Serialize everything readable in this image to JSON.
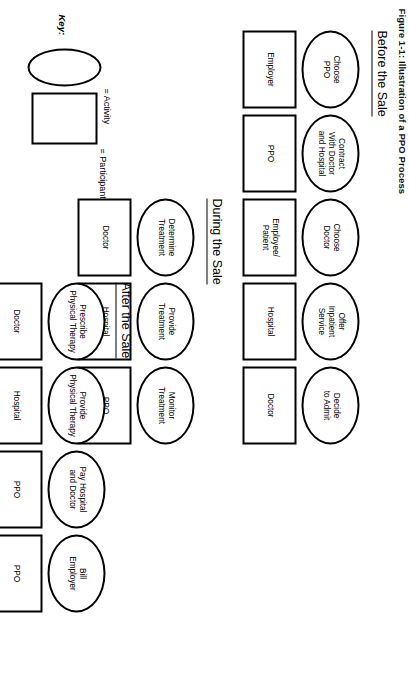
{
  "figure": {
    "caption": "Figure 1-1: Illustration of a PPO Process"
  },
  "sections": [
    {
      "id": "before-the-sale",
      "title": "Before the Sale",
      "nodes": [
        {
          "activity": "Choose\nPPO",
          "participant": "Employer"
        },
        {
          "activity": "Contract\nWith Doctor\nand Hospital",
          "participant": "PPO"
        },
        {
          "activity": "Choose\nDoctor",
          "participant": "Employee/\nPatient"
        },
        {
          "activity": "Offer\nInpatient\nService",
          "participant": "Hospital"
        },
        {
          "activity": "Decide\nto Admit",
          "participant": "Doctor"
        }
      ]
    },
    {
      "id": "during-the-sale",
      "title": "During the Sale",
      "nodes": [
        {
          "activity": "Determine\nTreatment",
          "participant": "Doctor"
        },
        {
          "activity": "Provide\nTreatment",
          "participant": "Hospital"
        },
        {
          "activity": "Monitor\nTreatment",
          "participant": "PPO"
        }
      ]
    },
    {
      "id": "after-the-sale",
      "title": "After the Sale",
      "nodes": [
        {
          "activity": "Prescribe\nPhysical Therapy",
          "participant": "Doctor"
        },
        {
          "activity": "Provide\nPhysical Therapy",
          "participant": "Hospital"
        },
        {
          "activity": "Pay Hospital\nand Doctor",
          "participant": "PPO"
        },
        {
          "activity": "Bill\nEmployer",
          "participant": "PPO"
        }
      ]
    }
  ],
  "key": {
    "label": "Key:",
    "activity_text": "= Activity",
    "participant_text": "= Participant"
  },
  "colors": {
    "stroke": "#000000",
    "background": "#ffffff",
    "text": "#000000"
  }
}
